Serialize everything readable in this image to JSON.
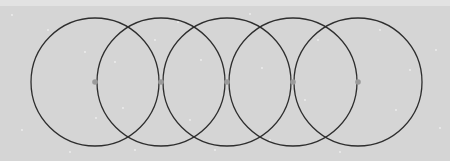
{
  "diagram": {
    "background_color": "#d5d5d5",
    "stroke_color": "#2e2e2e",
    "point_color": "#9a9a9a",
    "radius": 64,
    "center_y": 82,
    "circles": [
      {
        "cx": 95
      },
      {
        "cx": 161
      },
      {
        "cx": 227
      },
      {
        "cx": 293
      },
      {
        "cx": 358
      }
    ],
    "points": [
      {
        "x": 95,
        "y": 82
      },
      {
        "x": 161,
        "y": 82
      },
      {
        "x": 227,
        "y": 82
      },
      {
        "x": 293,
        "y": 82
      },
      {
        "x": 358,
        "y": 82
      }
    ],
    "speckles": [
      [
        12,
        15
      ],
      [
        48,
        30
      ],
      [
        85,
        52
      ],
      [
        115,
        62
      ],
      [
        123,
        108
      ],
      [
        96,
        118
      ],
      [
        22,
        130
      ],
      [
        70,
        152
      ],
      [
        135,
        150
      ],
      [
        178,
        22
      ],
      [
        190,
        120
      ],
      [
        201,
        60
      ],
      [
        250,
        14
      ],
      [
        262,
        68
      ],
      [
        270,
        140
      ],
      [
        305,
        100
      ],
      [
        318,
        40
      ],
      [
        340,
        152
      ],
      [
        380,
        30
      ],
      [
        396,
        110
      ],
      [
        410,
        70
      ],
      [
        436,
        50
      ],
      [
        440,
        128
      ],
      [
        215,
        150
      ],
      [
        155,
        40
      ]
    ]
  }
}
